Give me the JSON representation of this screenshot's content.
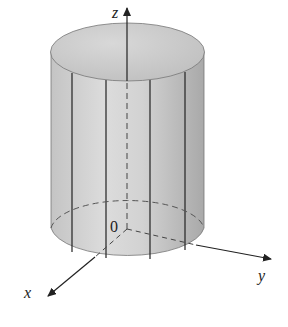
{
  "figure": {
    "axes": {
      "x_label": "x",
      "y_label": "y",
      "z_label": "z",
      "origin_label": "0"
    },
    "colors": {
      "cylinder_fill": "#c9c9c9",
      "top_fill": "#cfcfcf",
      "lines": "#222222"
    }
  }
}
